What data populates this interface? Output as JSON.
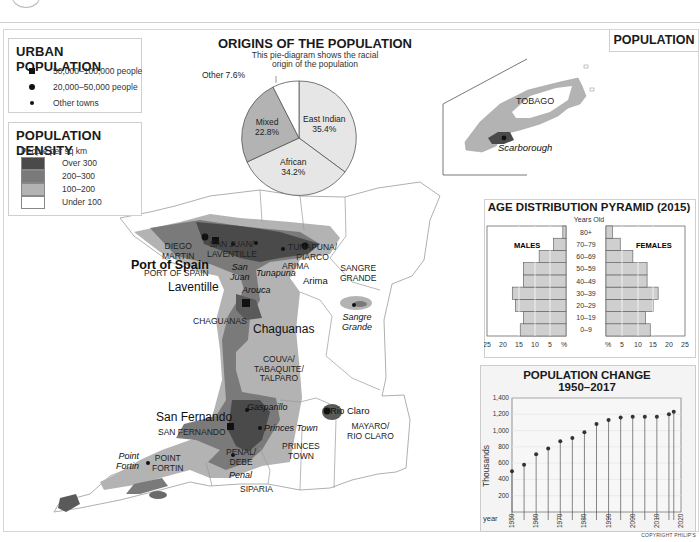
{
  "header": {
    "section_tag": "POPULATION"
  },
  "urban_legend": {
    "title": "URBAN POPULATION",
    "items": [
      {
        "symbol": "square",
        "label": "50,000–100,000 people"
      },
      {
        "symbol": "large-dot",
        "label": "20,000–50,000 people"
      },
      {
        "symbol": "small-dot",
        "label": "Other towns"
      }
    ]
  },
  "density_legend": {
    "title": "POPULATION DENSITY",
    "subtitle": "People per sq km",
    "classes": [
      {
        "label": "Over 300",
        "color": "#4a4a4a"
      },
      {
        "label": "200–300",
        "color": "#7a7a7a"
      },
      {
        "label": "100–200",
        "color": "#b3b3b3"
      },
      {
        "label": "Under 100",
        "color": "#ffffff"
      }
    ]
  },
  "origins": {
    "title": "ORIGINS OF THE POPULATION",
    "subtitle_line1": "This pie-diagram shows the racial",
    "subtitle_line2": "origin of the population",
    "labels": {
      "east_indian_name": "East Indian",
      "east_indian_pct": "35.4%",
      "african_name": "African",
      "african_pct": "34.2%",
      "mixed_name": "Mixed",
      "mixed_pct": "22.8%",
      "other": "Other 7.6%"
    }
  },
  "map": {
    "regions": {
      "diego_martin": [
        "DIEGO",
        "MARTIN"
      ],
      "san_juan_laventille": [
        "SAN JUAN/",
        "LAVENTILLE"
      ],
      "tunapuna_piarco": [
        "TUNAPUNA/",
        "PIARCO"
      ],
      "sangre_grande": [
        "SANGRE",
        "GRANDE"
      ],
      "port_of_spain": "PORT OF SPAIN",
      "arima": "ARIMA",
      "chaguanas": "CHAGUANAS",
      "couva": [
        "COUVA/",
        "TABAQUITE/",
        "TALPARO"
      ],
      "san_fernando": "SAN FERNANDO",
      "penal_debe": [
        "PENAL/",
        "DEBE"
      ],
      "point_fortin": [
        "POINT",
        "FORTIN"
      ],
      "siparia": "SIPARIA",
      "princes_town": [
        "PRINCES",
        "TOWN"
      ],
      "mayaro_rio_claro": [
        "MAYARO/",
        "RIO CLARO"
      ],
      "tobago": "TOBAGO"
    },
    "towns": {
      "port_of_spain": "Port of Spain",
      "laventille": "Laventille",
      "chaguanas": "Chaguanas",
      "san_fernando": "San Fernando",
      "san_juan": [
        "San",
        "Juan"
      ],
      "tunapuna": "Tunapuna",
      "arouca": "Arouca",
      "arima": "Arima",
      "sangre_grande": [
        "Sangre",
        "Grande"
      ],
      "gasparillo": "Gasparillo",
      "princes_town": "Princes Town",
      "rio_claro": "Rio Claro",
      "point_fortin": [
        "Point",
        "Fortin"
      ],
      "penal": "Penal",
      "scarborough": "Scarborough"
    }
  },
  "chart_data": [
    {
      "type": "bar",
      "title": "AGE DISTRIBUTION PYRAMID (2015)",
      "subtitle": "Years Old",
      "orientation": "horizontal-pyramid",
      "categories": [
        "0–9",
        "10–19",
        "20–29",
        "30–39",
        "40–49",
        "50–59",
        "60–69",
        "70–79",
        "80+"
      ],
      "series": [
        {
          "name": "MALES",
          "values": [
            14.5,
            13.5,
            16,
            17,
            13.5,
            13.5,
            8.5,
            4,
            1
          ]
        },
        {
          "name": "FEMALES",
          "values": [
            14,
            12.5,
            15,
            16.5,
            13,
            13,
            8.5,
            4.5,
            2
          ]
        }
      ],
      "xlabel": "%",
      "xticks": [
        "25",
        "20",
        "15",
        "10",
        "5",
        "%",
        "%",
        "5",
        "10",
        "15",
        "20",
        "25"
      ],
      "xlim": [
        0,
        25
      ]
    },
    {
      "type": "line",
      "style": "stem",
      "title": "POPULATION CHANGE",
      "subtitle": "1950–2017",
      "x": [
        1950,
        1955,
        1960,
        1965,
        1970,
        1975,
        1980,
        1985,
        1990,
        1995,
        2000,
        2005,
        2010,
        2015,
        2017
      ],
      "values": [
        500,
        580,
        710,
        780,
        870,
        910,
        980,
        1080,
        1130,
        1160,
        1170,
        1170,
        1170,
        1200,
        1230
      ],
      "xlabel": "year",
      "ylabel": "Thousands",
      "yticks": [
        "200",
        "400",
        "600",
        "800",
        "1,000",
        "1,200",
        "1,400"
      ],
      "xticks": [
        "1950",
        "1960",
        "1970",
        "1980",
        "1990",
        "2000",
        "2010",
        "2020"
      ],
      "ylim": [
        0,
        1400
      ],
      "grid": true
    }
  ],
  "footer": {
    "copyright": "COPYRIGHT PHILIP'S"
  }
}
